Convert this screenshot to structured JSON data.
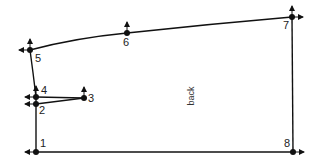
{
  "diagram": {
    "type": "pattern-draft",
    "piece_label": "back",
    "points": [
      {
        "id": "1",
        "label": "1",
        "x": 36,
        "y": 152,
        "arrows": [
          "left"
        ],
        "label_dx": 4,
        "label_dy": -5
      },
      {
        "id": "2",
        "label": "2",
        "x": 36,
        "y": 104,
        "arrows": [
          "left"
        ],
        "label_dx": 3,
        "label_dy": 10
      },
      {
        "id": "3",
        "label": "3",
        "x": 84,
        "y": 98,
        "arrows": [
          "up"
        ],
        "label_dx": 4,
        "label_dy": 4
      },
      {
        "id": "4",
        "label": "4",
        "x": 36,
        "y": 97,
        "arrows": [
          "left",
          "up"
        ],
        "label_dx": 5,
        "label_dy": -3
      },
      {
        "id": "5",
        "label": "5",
        "x": 30,
        "y": 50,
        "arrows": [
          "left",
          "up"
        ],
        "label_dx": 5,
        "label_dy": 12
      },
      {
        "id": "6",
        "label": "6",
        "x": 127,
        "y": 33,
        "arrows": [
          "up"
        ],
        "label_dx": -4,
        "label_dy": 13
      },
      {
        "id": "7",
        "label": "7",
        "x": 292,
        "y": 17,
        "arrows": [
          "up",
          "right"
        ],
        "label_dx": -9,
        "label_dy": 12
      },
      {
        "id": "8",
        "label": "8",
        "x": 293,
        "y": 152,
        "arrows": [
          "right"
        ],
        "label_dx": -9,
        "label_dy": -5
      }
    ],
    "lines": [
      {
        "from": "1",
        "to": "8"
      },
      {
        "from": "8",
        "to": "7"
      },
      {
        "from": "1",
        "to": "2"
      },
      {
        "from": "2",
        "to": "4"
      },
      {
        "from": "4",
        "to": "3"
      },
      {
        "from": "2",
        "to": "3"
      }
    ],
    "curves": [
      {
        "from": "4",
        "to": "5",
        "d": "M36,97 Q33,72 30,50"
      },
      {
        "from": "5",
        "to": "7",
        "d": "M30,50 Q75,38 127,33 Q210,24 292,17"
      }
    ],
    "colors": {
      "stroke": "#111111",
      "background": "#ffffff"
    }
  }
}
